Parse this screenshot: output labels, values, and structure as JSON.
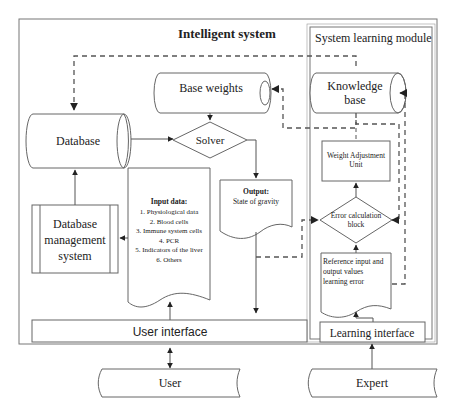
{
  "diagram": {
    "title": "Intelligent system",
    "learning_module_title": "System learning module",
    "nodes": {
      "base_weights": "Base weights",
      "database": "Database",
      "solver": "Solver",
      "dbms": [
        "Database",
        "management",
        "system"
      ],
      "input_data": {
        "heading": "Input data:",
        "items": [
          "1. Physiological data",
          "2. Blood cells",
          "3. Immune system cells",
          "4. PCR",
          "5. Indicators of the liver",
          "6. Others"
        ]
      },
      "output": {
        "heading": "Output:",
        "value": "State of gravity"
      },
      "knowledge_base": [
        "Knowledge",
        "base"
      ],
      "weight_adjustment": [
        "Weight Adjustment",
        "Unit"
      ],
      "error_calc": [
        "Error calculation",
        "block"
      ],
      "reference": [
        "Reference input and",
        "output values",
        "learning error"
      ],
      "user_interface": "User interface",
      "learning_interface": "Learning interface",
      "user": "User",
      "expert": "Expert"
    }
  }
}
